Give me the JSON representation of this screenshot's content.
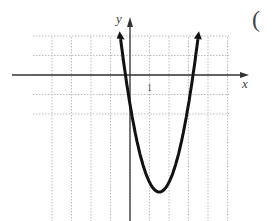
{
  "problem": {
    "label": "("
  },
  "chart_data": {
    "type": "line",
    "title": "",
    "xlabel": "x",
    "ylabel": "y",
    "x_tick_label": "1",
    "y_tick_label": "1",
    "xlim": [
      -5,
      5
    ],
    "ylim": [
      -7.5,
      2
    ],
    "grid": true,
    "series": [
      {
        "name": "parabola",
        "description": "upward-opening parabola with vertex near (1.5, -6), y-intercept near -4, arrows at both ends",
        "vertex": [
          1.5,
          -6
        ],
        "x": [
          -0.4,
          0,
          0.5,
          1,
          1.5,
          2,
          2.5,
          3,
          3.4
        ],
        "values": [
          1.2,
          -1.5,
          -4,
          -5.5,
          -6,
          -5.5,
          -4,
          -1.5,
          1.2
        ]
      }
    ]
  },
  "colors": {
    "curve": "#111111",
    "axes": "#333333",
    "grid": "#bdbdbd"
  }
}
